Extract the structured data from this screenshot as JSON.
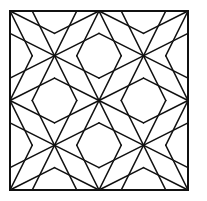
{
  "figure": {
    "stroke_color": "#111111",
    "background_color": "#ffffff",
    "frame": {
      "x": 10,
      "y": 11,
      "width": 178,
      "height": 179
    },
    "grid": {
      "rows": 2,
      "cols": 2
    },
    "tile_lines": [
      [
        0.25,
        0,
        0.75,
        1
      ],
      [
        0.75,
        0,
        0.25,
        1
      ],
      [
        0,
        0.25,
        1,
        0.75
      ],
      [
        0,
        0.75,
        1,
        0.25
      ],
      [
        0,
        0,
        0.5,
        0.25
      ],
      [
        0.5,
        0.25,
        1,
        0
      ],
      [
        0,
        1,
        0.5,
        0.75
      ],
      [
        0.5,
        0.75,
        1,
        1
      ],
      [
        0,
        0,
        0.25,
        0.5
      ],
      [
        0.25,
        0.5,
        0,
        1
      ],
      [
        1,
        0,
        0.75,
        0.5
      ],
      [
        0.75,
        0.5,
        1,
        1
      ]
    ]
  }
}
